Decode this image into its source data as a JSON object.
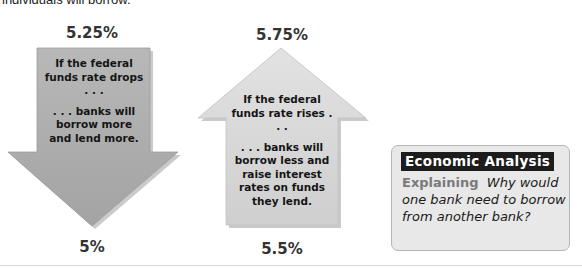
{
  "intro_text": "individuals will borrow.",
  "down_arrow": {
    "top_rate": "5.25%",
    "bottom_rate": "5%",
    "text_line1": "If the federal funds rate drops . . .",
    "text_line2": ". . . banks will borrow more and lend more.",
    "color": "#a9a9a9"
  },
  "up_arrow": {
    "top_rate": "5.75%",
    "bottom_rate": "5.5%",
    "text_line1": "If the federal funds rate rises . . .",
    "text_line2": ". . . banks will borrow less and raise interest rates on funds they lend.",
    "color": "#d6d6d6"
  },
  "econ_box": {
    "title": "Economic Analysis",
    "label": "Explaining",
    "question": "Why would one bank need to borrow from another bank?"
  }
}
